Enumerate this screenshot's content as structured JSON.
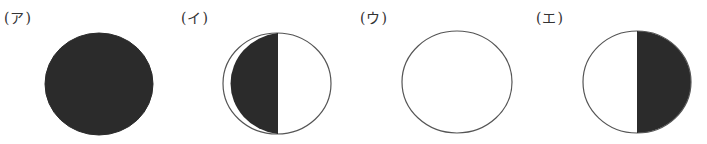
{
  "colors": {
    "dark": "#2b2b2b",
    "light": "#ffffff",
    "outline": "#555555"
  },
  "options": [
    {
      "label": "(ア)",
      "shading": "full-dark",
      "description": "Entire disc shaded dark",
      "label_pos": {
        "x": 4,
        "y": 10
      },
      "circle": {
        "cx": 99,
        "cy": 84,
        "rx": 54,
        "ry": 51
      }
    },
    {
      "label": "(イ)",
      "shading": "left-half-dark",
      "description": "Left half shaded dark, right half white",
      "label_pos": {
        "x": 181,
        "y": 10
      },
      "circle": {
        "cx": 277,
        "cy": 83,
        "rx": 54,
        "ry": 51
      }
    },
    {
      "label": "(ウ)",
      "shading": "full-light",
      "description": "Entire disc white (outline only)",
      "label_pos": {
        "x": 360,
        "y": 10
      },
      "circle": {
        "cx": 457,
        "cy": 82,
        "rx": 55,
        "ry": 51
      }
    },
    {
      "label": "(エ)",
      "shading": "right-half-dark",
      "description": "Left half white, right half shaded dark",
      "label_pos": {
        "x": 536,
        "y": 10
      },
      "circle": {
        "cx": 637,
        "cy": 82,
        "rx": 54,
        "ry": 51
      }
    }
  ]
}
